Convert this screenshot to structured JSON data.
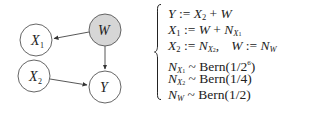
{
  "graph": {
    "nodes": [
      {
        "id": "X1",
        "label": "X",
        "sub": "1",
        "cx": 36,
        "cy": 40,
        "fill": "#ffffff"
      },
      {
        "id": "W",
        "label": "W",
        "sub": "",
        "cx": 105,
        "cy": 30,
        "fill": "#d6d6d6"
      },
      {
        "id": "X2",
        "label": "X",
        "sub": "2",
        "cx": 34,
        "cy": 76,
        "fill": "#ffffff"
      },
      {
        "id": "Y",
        "label": "Y",
        "sub": "",
        "cx": 105,
        "cy": 87,
        "fill": "#ffffff"
      }
    ],
    "edges": [
      {
        "from": "W",
        "to": "X1"
      },
      {
        "from": "W",
        "to": "Y"
      },
      {
        "from": "X2",
        "to": "Y"
      }
    ]
  },
  "equations": {
    "eq1": {
      "lhs": "Y",
      "op": " := ",
      "rhs_a": "X",
      "rhs_a_sub": "2",
      "plus": " + ",
      "rhs_b": "W"
    },
    "eq2": {
      "lhs": "X",
      "lhs_sub": "1",
      "op": " := ",
      "rhs_a": "W",
      "plus": " + ",
      "rhs_b": "N",
      "rhs_b_sub": "X",
      "rhs_b_subsub": "1"
    },
    "eq3": {
      "lhs": "X",
      "lhs_sub": "2",
      "op": " := ",
      "rhs_a": "N",
      "rhs_a_sub": "X",
      "rhs_a_subsub": "2",
      "sep": ",",
      "lhs2": "W",
      "op2": " := ",
      "rhs2": "N",
      "rhs2_sub": "W"
    },
    "eq4": {
      "lhs": "N",
      "lhs_sub": "X",
      "lhs_subsub": "1",
      "tilde": " ~ ",
      "dist": "Bern",
      "param": "(1/2",
      "param_exp": "6",
      "close": ")"
    },
    "eq5": {
      "lhs": "N",
      "lhs_sub": "X",
      "lhs_subsub": "2",
      "tilde": " ~ ",
      "dist": "Bern",
      "param": "(1/4)"
    },
    "eq6": {
      "lhs": "N",
      "lhs_sub": "W",
      "tilde": " ~ ",
      "dist": "Bern",
      "param": "(1/2)"
    }
  }
}
